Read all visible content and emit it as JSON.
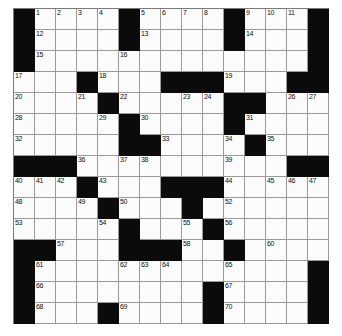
{
  "puzzle": {
    "title": "Crossword Puzzle Grid",
    "rows": 15,
    "columns": 15,
    "cell_size_px": 21,
    "colors": {
      "block": "#0b0b0b",
      "open": "#fbfbfb",
      "grid_line": "#9a9a9a",
      "number_text": "#111111",
      "page_background": "#ffffff"
    },
    "highest_clue_number": 70,
    "layout_legend": {
      "block": "#",
      "open_cell": ".",
      "note": "Each string is one row of 15 characters, left to right, top to bottom."
    },
    "grid_rows": [
      "#....#....#...#",
      "#....#....#...#",
      "#.............#",
      "...#...###...##",
      "....#.....##...",
      ".....#....#....",
      ".....##....#...",
      "###..........##",
      "...#...###.....",
      "....#...#......",
      ".....#...#.....",
      "##...###..#....",
      "#.............#",
      "#........#....#",
      "#...#....#....#"
    ],
    "numbered_cells": [
      {
        "number": 1,
        "row": 0,
        "col": 1
      },
      {
        "number": 2,
        "row": 0,
        "col": 2
      },
      {
        "number": 3,
        "row": 0,
        "col": 3
      },
      {
        "number": 4,
        "row": 0,
        "col": 4
      },
      {
        "number": 5,
        "row": 0,
        "col": 6
      },
      {
        "number": 6,
        "row": 0,
        "col": 7
      },
      {
        "number": 7,
        "row": 0,
        "col": 8
      },
      {
        "number": 8,
        "row": 0,
        "col": 9
      },
      {
        "number": 9,
        "row": 0,
        "col": 11
      },
      {
        "number": 10,
        "row": 0,
        "col": 12
      },
      {
        "number": 11,
        "row": 0,
        "col": 13
      },
      {
        "number": 12,
        "row": 1,
        "col": 1
      },
      {
        "number": 13,
        "row": 1,
        "col": 6
      },
      {
        "number": 14,
        "row": 1,
        "col": 11
      },
      {
        "number": 15,
        "row": 2,
        "col": 1
      },
      {
        "number": 16,
        "row": 2,
        "col": 5
      },
      {
        "number": 17,
        "row": 3,
        "col": 0
      },
      {
        "number": 18,
        "row": 3,
        "col": 4
      },
      {
        "number": 19,
        "row": 3,
        "col": 10
      },
      {
        "number": 20,
        "row": 4,
        "col": 0
      },
      {
        "number": 21,
        "row": 4,
        "col": 3
      },
      {
        "number": 22,
        "row": 4,
        "col": 5
      },
      {
        "number": 23,
        "row": 4,
        "col": 8
      },
      {
        "number": 24,
        "row": 4,
        "col": 9
      },
      {
        "number": 25,
        "row": 4,
        "col": 10
      },
      {
        "number": 26,
        "row": 4,
        "col": 13
      },
      {
        "number": 27,
        "row": 4,
        "col": 14
      },
      {
        "number": 28,
        "row": 5,
        "col": 0
      },
      {
        "number": 29,
        "row": 5,
        "col": 4
      },
      {
        "number": 30,
        "row": 5,
        "col": 6
      },
      {
        "number": 31,
        "row": 5,
        "col": 11
      },
      {
        "number": 32,
        "row": 6,
        "col": 0
      },
      {
        "number": 33,
        "row": 6,
        "col": 7
      },
      {
        "number": 34,
        "row": 6,
        "col": 10
      },
      {
        "number": 35,
        "row": 6,
        "col": 12
      },
      {
        "number": 36,
        "row": 7,
        "col": 3
      },
      {
        "number": 37,
        "row": 7,
        "col": 5
      },
      {
        "number": 38,
        "row": 7,
        "col": 6
      },
      {
        "number": 39,
        "row": 7,
        "col": 10
      },
      {
        "number": 40,
        "row": 8,
        "col": 0
      },
      {
        "number": 41,
        "row": 8,
        "col": 1
      },
      {
        "number": 42,
        "row": 8,
        "col": 2
      },
      {
        "number": 43,
        "row": 8,
        "col": 4
      },
      {
        "number": 44,
        "row": 8,
        "col": 10
      },
      {
        "number": 45,
        "row": 8,
        "col": 12
      },
      {
        "number": 46,
        "row": 8,
        "col": 13
      },
      {
        "number": 47,
        "row": 8,
        "col": 14
      },
      {
        "number": 48,
        "row": 9,
        "col": 0
      },
      {
        "number": 49,
        "row": 9,
        "col": 3
      },
      {
        "number": 50,
        "row": 9,
        "col": 5
      },
      {
        "number": 51,
        "row": 9,
        "col": 8
      },
      {
        "number": 52,
        "row": 9,
        "col": 10
      },
      {
        "number": 53,
        "row": 10,
        "col": 0
      },
      {
        "number": 54,
        "row": 10,
        "col": 4
      },
      {
        "number": 55,
        "row": 10,
        "col": 8
      },
      {
        "number": 56,
        "row": 10,
        "col": 10
      },
      {
        "number": 57,
        "row": 11,
        "col": 2
      },
      {
        "number": 58,
        "row": 11,
        "col": 8
      },
      {
        "number": 59,
        "row": 11,
        "col": 10
      },
      {
        "number": 60,
        "row": 11,
        "col": 12
      },
      {
        "number": 61,
        "row": 12,
        "col": 1
      },
      {
        "number": 62,
        "row": 12,
        "col": 5
      },
      {
        "number": 63,
        "row": 12,
        "col": 6
      },
      {
        "number": 64,
        "row": 12,
        "col": 7
      },
      {
        "number": 65,
        "row": 12,
        "col": 10
      },
      {
        "number": 66,
        "row": 13,
        "col": 1
      },
      {
        "number": 67,
        "row": 13,
        "col": 10
      },
      {
        "number": 68,
        "row": 14,
        "col": 1
      },
      {
        "number": 69,
        "row": 14,
        "col": 5
      },
      {
        "number": 70,
        "row": 14,
        "col": 10
      }
    ]
  }
}
